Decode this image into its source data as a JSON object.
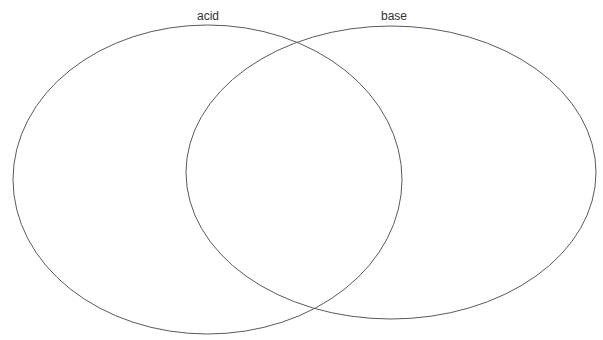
{
  "diagram": {
    "type": "venn",
    "sets": [
      {
        "label": "acid",
        "cx": 207.5,
        "cy": 179.5,
        "rx": 194.5,
        "ry": 154.5,
        "label_x": 208
      },
      {
        "label": "base",
        "cx": 391,
        "cy": 172.5,
        "rx": 205,
        "ry": 146.5,
        "label_x": 394
      }
    ],
    "regions": {
      "acid_only": [],
      "both": [],
      "base_only": []
    },
    "stroke_color": "#5a5a5a",
    "label_color": "#333333"
  }
}
